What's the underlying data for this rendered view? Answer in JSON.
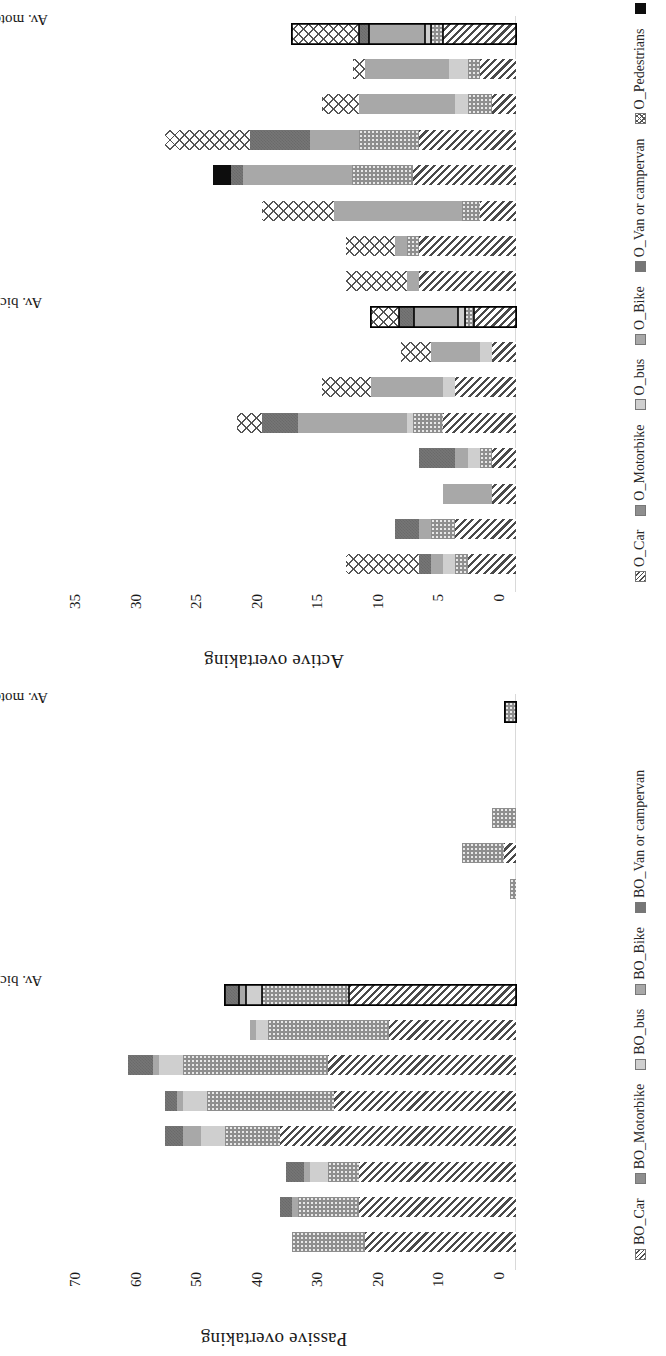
{
  "figure": {
    "orientation": "rotated-90",
    "panels": [
      "passive",
      "active"
    ]
  },
  "chart_data": [
    {
      "id": "passive",
      "type": "bar",
      "stacked": true,
      "title": "Passive overtaking",
      "ylabel": "Passive overtaking",
      "xlabel": "",
      "ylim": [
        0,
        70
      ],
      "yticks": [
        0,
        10,
        20,
        30,
        40,
        50,
        60,
        70
      ],
      "grid": false,
      "legend_position": "bottom",
      "categories": [
        "1B",
        "2B",
        "3B",
        "4B",
        "5B",
        "6B",
        "7B",
        "Av. bicycl.",
        "1M",
        "2M",
        "3M",
        "4M",
        "5M",
        "6M",
        "7M",
        "Av. motorc."
      ],
      "series": [
        {
          "name": "BO_Car",
          "pattern": "p-car",
          "values": [
            25,
            26,
            26,
            39,
            30,
            31,
            21,
            27.5,
            0,
            0,
            0,
            2,
            0,
            0,
            0,
            0
          ]
        },
        {
          "name": "BO_Motorbike",
          "pattern": "p-motorbike",
          "values": [
            12,
            10,
            5,
            9,
            21,
            24,
            20,
            14.5,
            0,
            0,
            1,
            7,
            4,
            0,
            0,
            1.8
          ]
        },
        {
          "name": "BO_bus",
          "pattern": "p-bus",
          "values": [
            0,
            0,
            3,
            4,
            4,
            4,
            2,
            2.5,
            0,
            0,
            0,
            0,
            0,
            0,
            0,
            0
          ]
        },
        {
          "name": "BO_Bike",
          "pattern": "p-bike",
          "values": [
            0,
            1,
            1,
            3,
            1,
            1,
            1,
            1.2,
            0,
            0,
            0,
            0,
            0,
            0,
            0,
            0
          ]
        },
        {
          "name": "BO_Van or campervan",
          "pattern": "p-van",
          "values": [
            0,
            2,
            3,
            3,
            2,
            4,
            0,
            2.3,
            0,
            0,
            0,
            0,
            0,
            0,
            0,
            0
          ]
        }
      ],
      "totals": [
        37,
        39,
        38,
        58,
        59,
        64,
        44,
        48,
        0,
        0,
        1,
        9,
        4,
        0,
        0,
        1.8
      ]
    },
    {
      "id": "active",
      "type": "bar",
      "stacked": true,
      "title": "Active overtaking",
      "ylabel": "Active overtaking",
      "xlabel": "",
      "ylim": [
        0,
        35
      ],
      "yticks": [
        0,
        5,
        10,
        15,
        20,
        25,
        30,
        35
      ],
      "grid": false,
      "legend_position": "bottom",
      "categories": [
        "1B",
        "2B",
        "3B",
        "4B",
        "5B",
        "6B",
        "7B",
        "Av. bicycl.",
        "1M",
        "2M",
        "3M",
        "4M",
        "5M",
        "6M",
        "7M",
        "Av. motorc."
      ],
      "series": [
        {
          "name": "O_Car",
          "pattern": "p-car",
          "values": [
            4,
            5,
            2,
            2,
            6,
            5,
            2,
            3.5,
            8,
            8,
            3,
            8.5,
            8,
            2,
            3,
            6
          ]
        },
        {
          "name": "O_Motorbike",
          "pattern": "p-motorbike",
          "values": [
            1,
            2,
            0,
            1,
            2.5,
            0,
            0,
            0.7,
            0,
            1,
            1.5,
            5,
            5,
            2,
            1,
            1
          ]
        },
        {
          "name": "O_bus",
          "pattern": "p-bus",
          "values": [
            1,
            0,
            0,
            1,
            0.5,
            1,
            1,
            0.6,
            0,
            0,
            0,
            0,
            0,
            1,
            1.5,
            0.5
          ]
        },
        {
          "name": "O_Bike",
          "pattern": "p-bike",
          "values": [
            1,
            1,
            4,
            1,
            9,
            6,
            4,
            3.6,
            1,
            1,
            10.5,
            9,
            4,
            8,
            7,
            4.6
          ]
        },
        {
          "name": "O_Van or campervan",
          "pattern": "p-van",
          "values": [
            1,
            2,
            0,
            3,
            3,
            0,
            0,
            1.3,
            0,
            0,
            0,
            1,
            5,
            0,
            0,
            0.9
          ]
        },
        {
          "name": "O_Pedestrians",
          "pattern": "p-ped",
          "values": [
            6,
            0,
            0,
            0,
            2,
            4,
            2.5,
            2.3,
            5,
            4,
            6,
            0,
            7,
            3,
            1,
            5.5
          ]
        },
        {
          "name": "Overtaking_trial",
          "pattern": "p-trial",
          "values": [
            0,
            0,
            0,
            0,
            0,
            0,
            0,
            0,
            0,
            0,
            0,
            1.5,
            0,
            0,
            0,
            0
          ]
        }
      ],
      "totals": [
        14,
        10,
        6,
        8,
        23,
        16,
        9.5,
        12,
        13,
        14,
        21,
        25,
        29,
        16,
        13.5,
        18.5
      ]
    }
  ],
  "panels": {
    "passive": {
      "ylabel": "Passive overtaking",
      "yticks": [
        "0",
        "10",
        "20",
        "30",
        "40",
        "50",
        "60",
        "70"
      ],
      "categories": [
        "1B",
        "2B",
        "3B",
        "4B",
        "5B",
        "6B",
        "7B",
        "Av. bicycl.",
        "1M",
        "2M",
        "3M",
        "4M",
        "5M",
        "6M",
        "7M",
        "Av. motorc."
      ],
      "legend": [
        "BO_Car",
        "BO_Motorbike",
        "BO_bus",
        "BO_Bike",
        "BO_Van or campervan"
      ]
    },
    "active": {
      "ylabel": "Active overtaking",
      "yticks": [
        "0",
        "5",
        "10",
        "15",
        "20",
        "25",
        "30",
        "35"
      ],
      "categories": [
        "1B",
        "2B",
        "3B",
        "4B",
        "5B",
        "6B",
        "7B",
        "Av. bicycl.",
        "1M",
        "2M",
        "3M",
        "4M",
        "5M",
        "6M",
        "7M",
        "Av. motorc."
      ],
      "legend": [
        "O_Car",
        "O_Motorbike",
        "O_bus",
        "O_Bike",
        "O_Van or campervan",
        "O_Pedestrians",
        "Overtaking_trial"
      ]
    }
  },
  "colors": {
    "car": "#4a4a4a",
    "motorbike": "#8e8e8e",
    "bus": "#cfcfcf",
    "bike": "#a8a8a8",
    "van": "#767676",
    "pedestrians": "#ffffff",
    "trial": "#0d0d0d",
    "axis": "#d9d9d9",
    "text": "#1a1a1a"
  }
}
